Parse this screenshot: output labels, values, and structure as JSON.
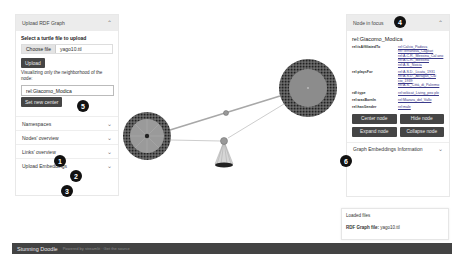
{
  "left_panel": {
    "header": "Upload RDF Graph",
    "select_label": "Select a turtle file to upload",
    "choose_file_label": "Choose file",
    "file_name": "yago10.ttl",
    "upload_label": "Upload",
    "hint": "Visualizing only the neighborhood of the node:",
    "center_node_value": "rel:Giacomo_Modica",
    "set_center_label": "Set new center",
    "accordions": [
      {
        "label": "Namespaces"
      },
      {
        "label": "Nodes' overview"
      },
      {
        "label": "Links' overview"
      },
      {
        "label": "Upload Embeddings"
      }
    ]
  },
  "right_panel": {
    "header": "Node in focus",
    "node_name": "rel:Giacomo_Modica",
    "properties": [
      {
        "key": "rel:isAffiliatedTo",
        "values": [
          "rel:Calcio_Padova",
          "rel:Terranova_Cagliari",
          "rel:A.C.R._Messina_Cal ano",
          "rel:A.C.R._Messina",
          "rel:A.S._Noicia"
        ]
      },
      {
        "key": "rel:playsFor",
        "values": [
          "rel:A.S.D._Licata_1931",
          "rel:A.S.D._Akragas_Cal cio_1939",
          "rel:A.S._Città_di_Palermo"
        ]
      },
      {
        "key": "rdf:type",
        "values": [
          "rel:wikicat_Living_peo ple"
        ]
      },
      {
        "key": "rel:wasBornIn",
        "values": [
          "rel:Mazara_del_Vallo"
        ]
      },
      {
        "key": "rel:hasGender",
        "values": [
          "rel:male"
        ]
      }
    ],
    "buttons": {
      "center": "Center node",
      "hide": "Hide node",
      "expand": "Expand node",
      "collapse": "Collapse node"
    },
    "embeddings_label": "Graph Embeddings Information"
  },
  "loaded_files": {
    "title": "Loaded files",
    "rdf_label": "RDF Graph file:",
    "rdf_value": "yago10.ttl"
  },
  "footer": {
    "title": "Stunning Doodle",
    "subtitle": "Powered by streamlit · Get the source"
  },
  "badges": [
    "1",
    "2",
    "3",
    "4",
    "5",
    "6"
  ],
  "graph": {
    "edge_color": "#b0b0b0",
    "node_fill": "#8a8a8a",
    "node_ring": "#3a3a3a"
  }
}
